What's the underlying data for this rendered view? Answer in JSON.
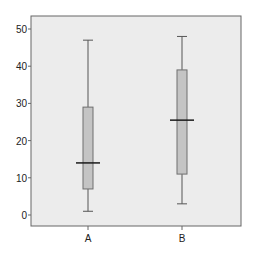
{
  "chart_data": {
    "type": "boxplot",
    "title": "",
    "xlabel": "",
    "ylabel": "",
    "ylim": [
      -3,
      53
    ],
    "yticks": [
      0,
      10,
      20,
      30,
      40,
      50
    ],
    "ytick_labels": [
      "0",
      "10",
      "20",
      "30",
      "40",
      "50"
    ],
    "categories": [
      "A",
      "B"
    ],
    "grid": false,
    "legend": "none",
    "series": [
      {
        "name": "A",
        "whisker_low": 1,
        "q1": 7,
        "median": 14,
        "q3": 29,
        "whisker_high": 47
      },
      {
        "name": "B",
        "whisker_low": 3,
        "q1": 11,
        "median": 25.5,
        "q3": 39,
        "whisker_high": 48
      }
    ],
    "colors": {
      "plot_background": "#ececec",
      "box_fill": "#c4c4c4",
      "box_stroke": "#6e6e6e",
      "median": "#1a1a1a",
      "whisker": "#555555",
      "frame": "#666666"
    }
  }
}
